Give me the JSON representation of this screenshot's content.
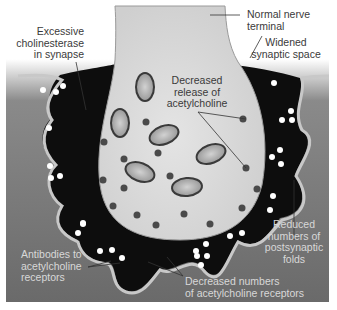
{
  "diagram": {
    "labels": {
      "normal_nerve_terminal": [
        "Normal nerve",
        "terminal"
      ],
      "excessive_cholinesterase": [
        "Excessive",
        "cholinesterase",
        "in synapse"
      ],
      "widened_synaptic_space": [
        "Widened",
        "synaptic space"
      ],
      "decreased_release": [
        "Decreased",
        "release of",
        "acetylcholine"
      ],
      "reduced_folds": [
        "Reduced",
        "numbers of",
        "postsynaptic",
        "folds"
      ],
      "antibodies": [
        "Antibodies to",
        "acetylcholine",
        "receptors"
      ],
      "decreased_receptors": [
        "Decreased numbers",
        "of acetylcholine receptors"
      ]
    },
    "colors": {
      "background": "#ffffff",
      "panel_top": "#ffffff",
      "panel_muscle": "#6e6e6e",
      "cleft": "#0c0c0c",
      "terminal_fill": "#dcdcdc",
      "terminal_edge": "#bdbdbd",
      "vesicle": "#4a4a4a",
      "mito_fill": "#a8a8a8",
      "membrane": "#c8c8c8",
      "ach_dot": "#ffffff",
      "text": "#3a3a3a"
    }
  }
}
